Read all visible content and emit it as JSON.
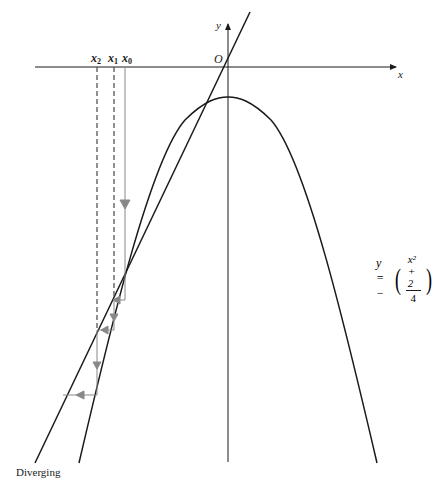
{
  "diagram": {
    "title": "Diverging",
    "axes": {
      "x_label": "x",
      "y_label": "y",
      "origin_label": "O"
    },
    "iterate_labels": [
      {
        "base": "x",
        "sub": "2"
      },
      {
        "base": "x",
        "sub": "1"
      },
      {
        "base": "x",
        "sub": "0"
      }
    ],
    "equation": {
      "lhs": "y = −",
      "numerator": "x² + 2",
      "denominator": "4"
    },
    "colors": {
      "curve": "#1a1a1a",
      "axis": "#1a1a1a",
      "iteration_path": "#888888",
      "dashed": "#666666"
    }
  }
}
